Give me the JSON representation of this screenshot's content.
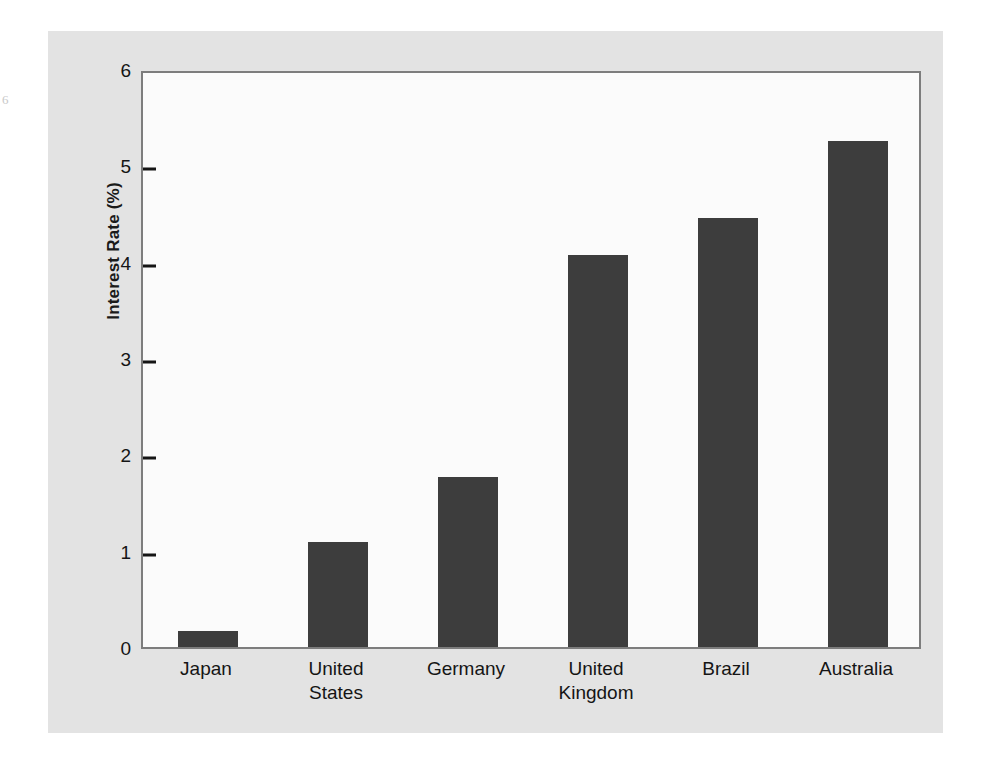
{
  "page": {
    "artifact_glyph": "6"
  },
  "chart_data": {
    "type": "bar",
    "title": "",
    "xlabel": "",
    "ylabel": "Interest Rate (%)",
    "categories": [
      "Japan",
      "United\nStates",
      "Germany",
      "United\nKingdom",
      "Brazil",
      "Australia"
    ],
    "values": [
      0.17,
      1.09,
      1.76,
      4.07,
      4.45,
      5.25
    ],
    "ylim": [
      0,
      6
    ],
    "yticks": [
      0,
      1,
      2,
      3,
      4,
      5,
      6
    ],
    "ytick_labels": [
      "0",
      "1",
      "2",
      "3",
      "4",
      "5",
      "6"
    ],
    "grid": false,
    "legend": false,
    "bar_color": "#3d3d3d",
    "plot_background": "#fbfbfb",
    "figure_background": "#e3e3e3",
    "axis_color": "#7d7d7d"
  }
}
